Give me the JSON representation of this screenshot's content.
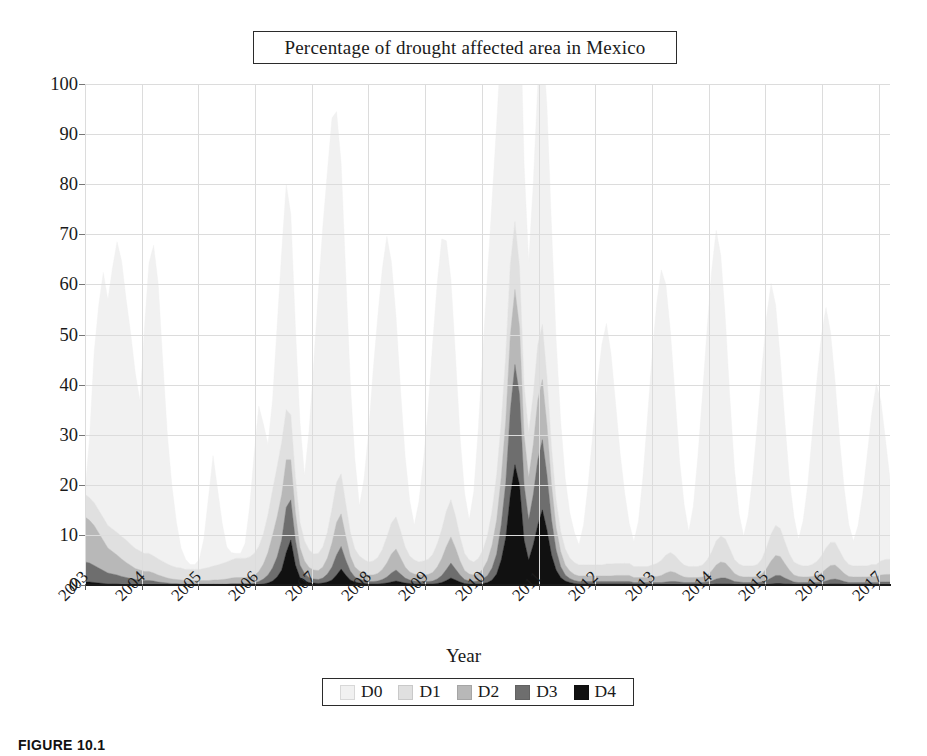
{
  "figure": {
    "caption": "FIGURE 10.1"
  },
  "chart_data": {
    "type": "area",
    "stacked": true,
    "title": "Percentage of drought affected area in Mexico",
    "xlabel": "Year",
    "ylabel": "",
    "ylim": [
      0,
      100
    ],
    "yticks": [
      0,
      10,
      20,
      30,
      40,
      50,
      60,
      70,
      80,
      90,
      100
    ],
    "ytick_labels": [
      "0",
      "10",
      "20",
      "30",
      "40",
      "50",
      "60",
      "70",
      "80",
      "90",
      "100"
    ],
    "xlim": [
      2003,
      2017.2
    ],
    "xticks": [
      2003,
      2004,
      2005,
      2006,
      2007,
      2008,
      2009,
      2010,
      2011,
      2012,
      2013,
      2014,
      2015,
      2016,
      2017
    ],
    "xtick_labels": [
      "2003",
      "2004",
      "2005",
      "2006",
      "2007",
      "2008",
      "2009",
      "2010",
      "2011",
      "2012",
      "2013",
      "2014",
      "2015",
      "2016",
      "2017"
    ],
    "grid": true,
    "legend_position": "bottom",
    "legend": [
      "D0",
      "D1",
      "D2",
      "D3",
      "D4"
    ],
    "colors": {
      "D0": "#f1f1f1",
      "D1": "#e0e0e0",
      "D2": "#b8b8b8",
      "D3": "#6e6e6e",
      "D4": "#111111"
    },
    "series": [
      {
        "name": "D4",
        "color": "#111111",
        "values": [
          0.6,
          0.6,
          0.5,
          0.4,
          0.3,
          0.2,
          0.2,
          0.2,
          0.1,
          0.1,
          0.1,
          0.1,
          0.1,
          0.1,
          0.1,
          0.1,
          0.0,
          0.0,
          0.0,
          0.0,
          0.0,
          0.0,
          0.0,
          0.0,
          0.0,
          0.0,
          0.0,
          0.0,
          0.0,
          0.0,
          0.0,
          0.0,
          0.0,
          0.0,
          0.0,
          0.0,
          0.0,
          0.0,
          0.1,
          0.2,
          0.4,
          0.8,
          1.6,
          3.0,
          6.5,
          9.0,
          4.0,
          1.5,
          0.8,
          0.5,
          0.4,
          0.3,
          0.4,
          0.6,
          1.0,
          2.0,
          3.2,
          2.0,
          1.0,
          0.6,
          0.4,
          0.3,
          0.2,
          0.2,
          0.2,
          0.3,
          0.4,
          0.6,
          0.8,
          0.6,
          0.4,
          0.3,
          0.2,
          0.2,
          0.2,
          0.2,
          0.2,
          0.3,
          0.5,
          0.9,
          1.4,
          1.0,
          0.6,
          0.3,
          0.2,
          0.2,
          0.2,
          0.3,
          0.5,
          1.0,
          2.2,
          5.0,
          9.5,
          18.0,
          24.0,
          20.0,
          9.0,
          5.0,
          8.0,
          12.0,
          15.0,
          11.0,
          6.0,
          3.0,
          1.5,
          0.8,
          0.5,
          0.3,
          0.2,
          0.2,
          0.2,
          0.2,
          0.2,
          0.2,
          0.2,
          0.2,
          0.2,
          0.2,
          0.2,
          0.2,
          0.1,
          0.1,
          0.1,
          0.1,
          0.1,
          0.1,
          0.1,
          0.1,
          0.1,
          0.1,
          0.1,
          0.1,
          0.1,
          0.1,
          0.1,
          0.1,
          0.1,
          0.1,
          0.2,
          0.2,
          0.2,
          0.2,
          0.1,
          0.1,
          0.1,
          0.1,
          0.1,
          0.1,
          0.1,
          0.1,
          0.2,
          0.3,
          0.3,
          0.2,
          0.2,
          0.1,
          0.1,
          0.1,
          0.1,
          0.1,
          0.1,
          0.1,
          0.1,
          0.2,
          0.2,
          0.2,
          0.1,
          0.1,
          0.1,
          0.1,
          0.1,
          0.1,
          0.1,
          0.1,
          0.1,
          0.1,
          0.1
        ]
      },
      {
        "name": "D3",
        "color": "#6e6e6e",
        "values": [
          4.0,
          3.8,
          3.4,
          3.0,
          2.6,
          2.2,
          2.0,
          1.8,
          1.6,
          1.4,
          1.2,
          1.0,
          0.9,
          0.8,
          0.8,
          0.7,
          0.6,
          0.5,
          0.4,
          0.3,
          0.3,
          0.2,
          0.2,
          0.2,
          0.2,
          0.2,
          0.2,
          0.2,
          0.2,
          0.2,
          0.2,
          0.2,
          0.3,
          0.3,
          0.3,
          0.3,
          0.3,
          0.4,
          0.6,
          1.0,
          1.6,
          2.6,
          4.0,
          6.0,
          9.0,
          8.0,
          5.0,
          2.5,
          1.5,
          1.0,
          0.8,
          0.8,
          1.0,
          1.6,
          2.6,
          4.0,
          4.5,
          3.0,
          1.8,
          1.0,
          0.8,
          0.6,
          0.5,
          0.5,
          0.6,
          0.8,
          1.2,
          1.8,
          2.2,
          1.6,
          1.0,
          0.7,
          0.6,
          0.5,
          0.5,
          0.5,
          0.6,
          0.9,
          1.4,
          2.2,
          3.0,
          2.2,
          1.4,
          0.8,
          0.6,
          0.5,
          0.6,
          0.9,
          1.4,
          2.4,
          4.0,
          7.0,
          11.0,
          17.0,
          20.0,
          18.0,
          11.0,
          8.0,
          10.0,
          13.0,
          14.0,
          11.0,
          7.0,
          4.0,
          2.2,
          1.2,
          0.8,
          0.6,
          0.5,
          0.5,
          0.5,
          0.5,
          0.5,
          0.5,
          0.5,
          0.5,
          0.5,
          0.5,
          0.5,
          0.5,
          0.4,
          0.4,
          0.4,
          0.4,
          0.4,
          0.4,
          0.4,
          0.5,
          0.6,
          0.6,
          0.5,
          0.4,
          0.4,
          0.4,
          0.4,
          0.4,
          0.5,
          0.7,
          1.0,
          1.2,
          1.2,
          0.9,
          0.6,
          0.5,
          0.4,
          0.4,
          0.4,
          0.4,
          0.5,
          0.8,
          1.2,
          1.6,
          1.6,
          1.2,
          0.8,
          0.5,
          0.4,
          0.4,
          0.4,
          0.4,
          0.4,
          0.5,
          0.7,
          0.9,
          1.0,
          0.8,
          0.6,
          0.4,
          0.4,
          0.4,
          0.4,
          0.4,
          0.4,
          0.4,
          0.5,
          0.5,
          0.5
        ]
      },
      {
        "name": "D2",
        "color": "#b8b8b8",
        "values": [
          9.0,
          8.5,
          8.0,
          7.0,
          6.0,
          5.0,
          4.5,
          4.0,
          3.5,
          3.0,
          2.6,
          2.2,
          2.0,
          1.8,
          1.8,
          1.6,
          1.4,
          1.2,
          1.0,
          0.9,
          0.8,
          0.8,
          0.7,
          0.7,
          0.7,
          0.7,
          0.7,
          0.7,
          0.8,
          0.8,
          0.9,
          1.0,
          1.1,
          1.2,
          1.2,
          1.2,
          1.3,
          1.5,
          2.0,
          3.0,
          4.5,
          6.5,
          8.0,
          9.0,
          9.5,
          8.0,
          5.5,
          3.5,
          2.5,
          2.0,
          1.8,
          1.8,
          2.2,
          3.2,
          4.8,
          6.5,
          6.5,
          4.8,
          3.0,
          2.0,
          1.6,
          1.4,
          1.3,
          1.3,
          1.5,
          2.0,
          2.8,
          3.8,
          4.2,
          3.2,
          2.2,
          1.6,
          1.4,
          1.3,
          1.3,
          1.4,
          1.7,
          2.4,
          3.4,
          4.6,
          5.2,
          4.2,
          2.8,
          1.8,
          1.4,
          1.3,
          1.5,
          2.0,
          3.0,
          4.6,
          6.8,
          9.5,
          12.5,
          15.0,
          15.0,
          13.5,
          10.0,
          8.5,
          10.0,
          12.0,
          12.0,
          10.0,
          7.0,
          4.5,
          3.0,
          2.0,
          1.5,
          1.2,
          1.1,
          1.1,
          1.1,
          1.1,
          1.1,
          1.1,
          1.1,
          1.1,
          1.2,
          1.2,
          1.2,
          1.2,
          1.0,
          1.0,
          1.0,
          1.0,
          1.1,
          1.2,
          1.4,
          1.8,
          2.0,
          1.8,
          1.4,
          1.1,
          1.0,
          1.0,
          1.0,
          1.1,
          1.4,
          2.0,
          2.8,
          3.2,
          3.0,
          2.3,
          1.6,
          1.2,
          1.1,
          1.1,
          1.1,
          1.2,
          1.6,
          2.4,
          3.4,
          4.0,
          3.8,
          2.9,
          2.0,
          1.4,
          1.2,
          1.1,
          1.1,
          1.2,
          1.4,
          1.8,
          2.4,
          2.8,
          2.8,
          2.2,
          1.6,
          1.2,
          1.1,
          1.1,
          1.1,
          1.1,
          1.2,
          1.2,
          1.4,
          1.5,
          1.5
        ]
      },
      {
        "name": "D1",
        "color": "#e0e0e0",
        "values": [
          4.5,
          4.5,
          4.5,
          4.5,
          4.5,
          4.5,
          4.5,
          4.5,
          4.5,
          4.5,
          4.2,
          4.0,
          3.8,
          3.6,
          3.6,
          3.4,
          3.2,
          3.0,
          2.8,
          2.6,
          2.4,
          2.4,
          2.2,
          2.2,
          2.2,
          2.2,
          2.4,
          2.6,
          2.8,
          3.0,
          3.2,
          3.4,
          3.6,
          3.8,
          3.8,
          3.8,
          4.0,
          4.4,
          5.0,
          6.0,
          7.5,
          9.0,
          10.0,
          10.5,
          10.0,
          9.0,
          7.0,
          5.0,
          4.0,
          3.5,
          3.2,
          3.4,
          4.0,
          5.2,
          6.8,
          8.0,
          8.0,
          6.5,
          4.8,
          3.6,
          3.0,
          2.8,
          2.6,
          2.8,
          3.2,
          4.0,
          5.2,
          6.2,
          6.4,
          5.4,
          4.0,
          3.2,
          2.8,
          2.6,
          2.8,
          3.0,
          3.6,
          4.6,
          5.8,
          7.0,
          7.4,
          6.4,
          4.8,
          3.4,
          2.8,
          2.6,
          3.0,
          3.8,
          5.0,
          6.8,
          9.0,
          11.0,
          13.0,
          14.0,
          13.5,
          12.0,
          10.0,
          9.0,
          10.0,
          11.0,
          11.0,
          9.5,
          7.5,
          5.5,
          4.0,
          3.2,
          2.6,
          2.4,
          2.2,
          2.2,
          2.2,
          2.2,
          2.2,
          2.2,
          2.4,
          2.4,
          2.4,
          2.4,
          2.4,
          2.4,
          2.2,
          2.2,
          2.2,
          2.2,
          2.4,
          2.6,
          3.0,
          3.6,
          3.8,
          3.4,
          2.8,
          2.4,
          2.2,
          2.2,
          2.2,
          2.4,
          3.0,
          3.8,
          4.8,
          5.2,
          4.8,
          3.8,
          2.8,
          2.4,
          2.2,
          2.2,
          2.2,
          2.4,
          3.0,
          4.2,
          5.4,
          6.0,
          5.6,
          4.4,
          3.2,
          2.6,
          2.4,
          2.2,
          2.2,
          2.4,
          2.8,
          3.4,
          4.2,
          4.6,
          4.5,
          3.6,
          2.8,
          2.4,
          2.2,
          2.2,
          2.2,
          2.2,
          2.4,
          2.4,
          2.8,
          3.0,
          3.0
        ]
      },
      {
        "name": "D0",
        "color": "#f1f1f1",
        "values": [
          0.5,
          12.0,
          30.0,
          41.0,
          49.0,
          45.0,
          52.0,
          58.0,
          55.0,
          48.0,
          42.0,
          35.0,
          30.0,
          45.0,
          58.0,
          62.0,
          55.0,
          40.0,
          26.0,
          16.0,
          9.0,
          4.0,
          2.0,
          1.0,
          1.0,
          2.0,
          6.0,
          14.0,
          22.0,
          15.0,
          8.0,
          3.0,
          1.5,
          1.0,
          1.0,
          3.0,
          10.0,
          20.0,
          28.0,
          22.0,
          14.0,
          18.0,
          28.0,
          38.0,
          45.0,
          40.0,
          30.0,
          20.0,
          13.0,
          24.0,
          38.0,
          52.0,
          64.0,
          72.0,
          78.0,
          74.0,
          62.0,
          46.0,
          30.0,
          18.0,
          10.0,
          16.0,
          26.0,
          38.0,
          48.0,
          56.0,
          60.0,
          52.0,
          40.0,
          28.0,
          18.0,
          11.0,
          7.0,
          12.0,
          20.0,
          30.0,
          42.0,
          52.0,
          58.0,
          54.0,
          44.0,
          32.0,
          20.0,
          12.0,
          8.0,
          14.0,
          26.0,
          40.0,
          52.0,
          62.0,
          70.0,
          76.0,
          80.0,
          78.0,
          70.0,
          58.0,
          44.0,
          34.0,
          42.0,
          52.0,
          58.0,
          54.0,
          44.0,
          32.0,
          22.0,
          14.0,
          9.0,
          6.0,
          4.0,
          8.0,
          16.0,
          26.0,
          36.0,
          44.0,
          48.0,
          42.0,
          32.0,
          22.0,
          14.0,
          8.0,
          5.0,
          9.0,
          18.0,
          30.0,
          42.0,
          52.0,
          58.0,
          54.0,
          44.0,
          32.0,
          20.0,
          12.0,
          7.0,
          12.0,
          22.0,
          34.0,
          46.0,
          56.0,
          62.0,
          56.0,
          44.0,
          30.0,
          18.0,
          10.0,
          6.0,
          10.0,
          18.0,
          28.0,
          38.0,
          46.0,
          50.0,
          44.0,
          34.0,
          24.0,
          15.0,
          9.0,
          5.0,
          9.0,
          16.0,
          26.0,
          36.0,
          44.0,
          48.0,
          42.0,
          32.0,
          22.0,
          14.0,
          8.0,
          5.0,
          8.0,
          14.0,
          22.0,
          30.0,
          36.0,
          32.0,
          24.0,
          16.0
        ]
      }
    ],
    "annotations": {
      "peak_total_2011": 95,
      "peak_total_2006": 83,
      "peak_total_2008": 89
    }
  }
}
